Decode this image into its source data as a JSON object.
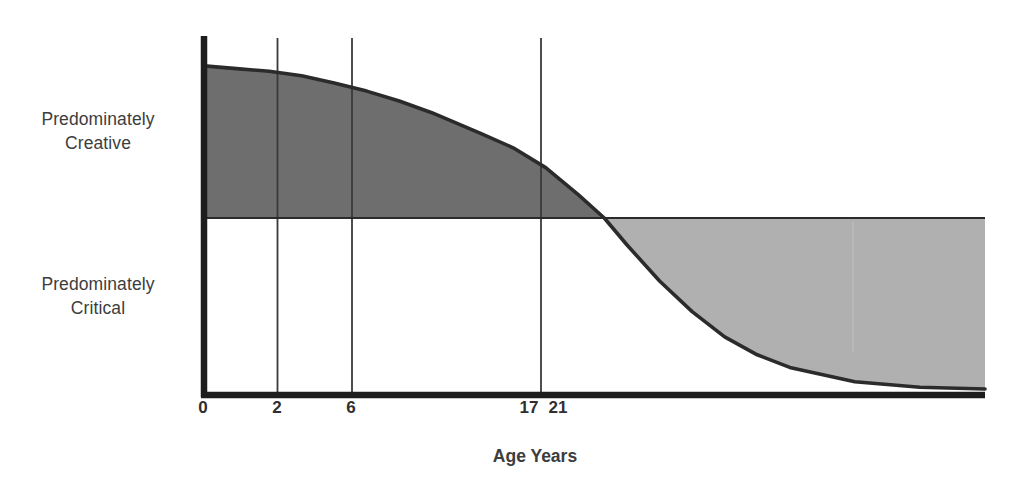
{
  "chart_data": {
    "type": "area",
    "title": "",
    "subtitle": "",
    "xlabel": "Age Years",
    "ylabel": "",
    "grid": true,
    "legend": "none",
    "xlim": [
      0,
      48
    ],
    "ylim": [
      -1,
      1
    ],
    "x_tick_labels": [
      "0",
      "2",
      "6",
      "17",
      "21"
    ],
    "x_tick_values": [
      0,
      2,
      6,
      17,
      21
    ],
    "gridline_values": [
      0,
      2,
      6,
      17
    ],
    "y_axis_regions": [
      {
        "name": "upper",
        "label": "Predominately Creative",
        "range": [
          0,
          1
        ],
        "fill": "#6e6e6e"
      },
      {
        "name": "lower",
        "label": "Predominately Critical",
        "range": [
          -1,
          0
        ],
        "fill": "#b0b0b0"
      }
    ],
    "zero_crossing_age": 24.6,
    "series": [
      {
        "name": "Creative vs Critical Thinking",
        "x": [
          0,
          2,
          4,
          6,
          8,
          10,
          12,
          14,
          17,
          19,
          21,
          23,
          24.6,
          26,
          28,
          30,
          32,
          34,
          36,
          40,
          44,
          48
        ],
        "y": [
          0.845,
          0.83,
          0.815,
          0.79,
          0.75,
          0.705,
          0.65,
          0.585,
          0.47,
          0.39,
          0.28,
          0.13,
          0.0,
          -0.15,
          -0.35,
          -0.52,
          -0.66,
          -0.76,
          -0.83,
          -0.91,
          -0.94,
          -0.95
        ]
      }
    ],
    "colors": {
      "creative_fill": "#6e6e6e",
      "critical_fill": "#b0b0b0",
      "curve_line": "#2b2b2b",
      "axis_line": "#1d1d1d",
      "gridline": "#3a3a3a",
      "midline": "#2b2b2b",
      "text": "#3d3d3d",
      "background": "#ffffff"
    }
  },
  "labels": {
    "creative": "Predominately\nCreative",
    "critical": "Predominately\nCritical",
    "axis_x": "Age Years"
  },
  "ticks": {
    "t0": "0",
    "t2": "2",
    "t6": "6",
    "t17": "17",
    "t21": "21"
  }
}
